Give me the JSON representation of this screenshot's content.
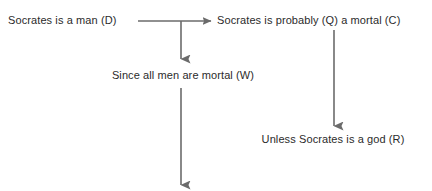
{
  "diagram": {
    "type": "argument-map",
    "canvas": {
      "width": 432,
      "height": 191,
      "background": "#ffffff"
    },
    "stroke_color": "#6b6b6b",
    "text_color": "#2b2b2b",
    "nodes": [
      {
        "id": "premise-d",
        "role": "data",
        "symbol": "D",
        "text": "Socrates is a man (D)"
      },
      {
        "id": "conclusion-c",
        "role": "claim",
        "symbol": "C",
        "qualifier": "Q",
        "text": "Socrates is probably (Q) a mortal (C)"
      },
      {
        "id": "warrant-w",
        "role": "warrant",
        "symbol": "W",
        "text": "Since all men are mortal (W)"
      },
      {
        "id": "rebuttal-r",
        "role": "rebuttal",
        "symbol": "R",
        "text": "Unless Socrates is a god (R)"
      }
    ],
    "connectors": [
      {
        "id": "arrow-data-to-claim",
        "orientation": "horizontal",
        "from": "premise-d",
        "to": "conclusion-c",
        "x1": 138,
        "y1": 21,
        "x2": 211,
        "y2": 21
      },
      {
        "id": "arrow-claim-to-warrant",
        "orientation": "vertical",
        "from": "arrow-data-to-claim",
        "to": "warrant-w",
        "x1": 181,
        "y1": 21,
        "x2": 181,
        "y2": 59
      },
      {
        "id": "arrow-warrant-downward",
        "orientation": "vertical",
        "from": "warrant-w",
        "to": null,
        "x1": 181,
        "y1": 88,
        "x2": 181,
        "y2": 185
      },
      {
        "id": "arrow-claim-to-rebuttal",
        "orientation": "vertical",
        "from": "conclusion-c",
        "to": "rebuttal-r",
        "x1": 334,
        "y1": 30,
        "x2": 334,
        "y2": 126
      }
    ]
  }
}
